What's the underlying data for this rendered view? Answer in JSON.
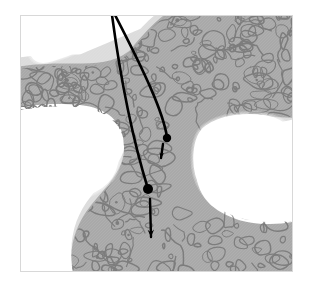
{
  "figure": {
    "caption": "",
    "canvas": {
      "width": 311,
      "height": 286,
      "background": "#ffffff"
    },
    "frame": {
      "name": "image-frame",
      "x": 20,
      "y": 15,
      "width": 273,
      "height": 257,
      "border_color": "#d8d8d8",
      "border_width": 1
    },
    "colors": {
      "background": "#ffffff",
      "marrow_space": "#ffffff",
      "cortical_halo": "#dcdcdc",
      "trabecular_fill": "#a9a9a9",
      "trabecular_outline": "#7d7d7d",
      "annotation": "#000000",
      "frame_border": "#d8d8d8"
    },
    "regions": [
      {
        "name": "upper-left-cortical-band",
        "label": "cortical band",
        "tone": "#dcdcdc"
      },
      {
        "name": "upper-right-trabecular-mass",
        "label": "trabecular bone",
        "tone": "#a9a9a9"
      },
      {
        "name": "left-trabecular-mass",
        "label": "trabecular bone",
        "tone": "#a9a9a9"
      },
      {
        "name": "lower-trabecular-mass",
        "label": "trabecular bone",
        "tone": "#a9a9a9"
      },
      {
        "name": "left-marrow-space",
        "label": "marrow space",
        "tone": "#ffffff"
      },
      {
        "name": "right-marrow-space",
        "label": "marrow space",
        "tone": "#ffffff"
      },
      {
        "name": "top-marrow-space",
        "label": "marrow space",
        "tone": "#ffffff"
      }
    ],
    "annotations": {
      "stroke_color": "#000000",
      "apex": {
        "x": 113,
        "y": 15
      },
      "curves": [
        {
          "name": "annotation-curve-outer",
          "start": {
            "x": 112,
            "y": 15
          },
          "control1": {
            "x": 122,
            "y": 90
          },
          "control2": {
            "x": 136,
            "y": 150
          },
          "end": {
            "x": 148,
            "y": 189
          },
          "width": 2.6
        },
        {
          "name": "annotation-curve-inner",
          "start": {
            "x": 115,
            "y": 15
          },
          "control1": {
            "x": 146,
            "y": 75
          },
          "control2": {
            "x": 163,
            "y": 112
          },
          "end": {
            "x": 167,
            "y": 137
          },
          "width": 2.6
        }
      ],
      "markers": [
        {
          "name": "marker-dot-upper",
          "x": 167,
          "y": 138,
          "r": 4.2
        },
        {
          "name": "marker-dot-lower",
          "x": 148,
          "y": 189,
          "r": 5.0
        }
      ],
      "arrows": [
        {
          "name": "arrow-short-upper",
          "start": {
            "x": 163,
            "y": 144
          },
          "end": {
            "x": 161,
            "y": 158
          },
          "width": 2.4,
          "head_size": 6
        },
        {
          "name": "arrow-long-lower",
          "start": {
            "x": 150,
            "y": 199
          },
          "end": {
            "x": 151,
            "y": 237
          },
          "width": 2.4,
          "head_size": 8
        }
      ]
    }
  }
}
